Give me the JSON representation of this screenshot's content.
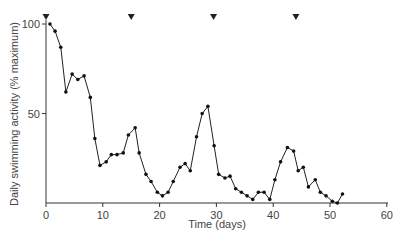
{
  "chart_data": {
    "type": "line",
    "title": "",
    "xlabel": "Time (days)",
    "ylabel": "Daily swimming activity (% maximum)",
    "xlim": [
      0,
      60
    ],
    "ylim": [
      0,
      100
    ],
    "x_ticks": [
      0,
      10,
      20,
      30,
      40,
      50,
      60
    ],
    "y_ticks": [
      50,
      100
    ],
    "grid": false,
    "legend": null,
    "markers": {
      "type": "triangle-down",
      "x": [
        0,
        15,
        29.5,
        44
      ]
    },
    "series": [
      {
        "name": "activity",
        "x": [
          0.7,
          1.6,
          2.6,
          3.5,
          4.6,
          5.6,
          6.7,
          7.8,
          8.6,
          9.5,
          10.6,
          11.5,
          12.5,
          13.6,
          14.5,
          15.7,
          16.4,
          17.6,
          18.5,
          19.6,
          20.5,
          21.5,
          22.4,
          23.6,
          24.5,
          25.4,
          26.5,
          27.5,
          28.5,
          29.6,
          30.4,
          31.5,
          32.4,
          33.4,
          34.4,
          35.4,
          36.4,
          37.4,
          38.4,
          39.4,
          40.3,
          41.3,
          42.5,
          43.6,
          44.4,
          45.3,
          46.2,
          47.4,
          48.3,
          49.3,
          50.4,
          51.3,
          52.2
        ],
        "y": [
          100,
          96,
          87,
          62,
          72,
          69,
          71,
          59,
          36,
          21,
          23,
          27,
          27,
          28,
          38,
          42,
          28,
          16,
          12,
          6,
          4,
          6,
          12,
          20,
          22,
          18,
          37,
          50,
          54,
          32,
          16,
          14,
          15,
          8,
          6,
          4,
          2,
          6,
          6,
          2,
          13,
          23,
          31,
          29,
          18,
          20,
          9,
          13,
          6,
          4,
          1,
          0,
          5
        ]
      }
    ]
  }
}
